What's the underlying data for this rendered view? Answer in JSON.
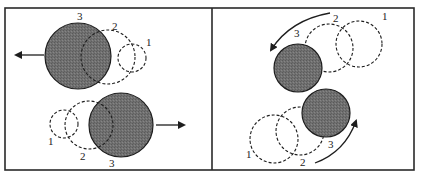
{
  "colors": {
    "frame": "#2a2a2a",
    "shaded_fill": "#6e6e6e",
    "outline": "#1e1e1e",
    "background": "#ffffff"
  },
  "panels": [
    {
      "name": "linear-motion",
      "groups": [
        {
          "direction": "left",
          "labels": [
            "1",
            "2",
            "3"
          ]
        },
        {
          "direction": "right",
          "labels": [
            "1",
            "2",
            "3"
          ]
        }
      ]
    },
    {
      "name": "rotational-motion",
      "groups": [
        {
          "direction": "counter-clockwise-arc",
          "labels": [
            "1",
            "2",
            "3"
          ]
        },
        {
          "direction": "counter-clockwise-arc",
          "labels": [
            "1",
            "2",
            "3"
          ]
        }
      ]
    }
  ]
}
